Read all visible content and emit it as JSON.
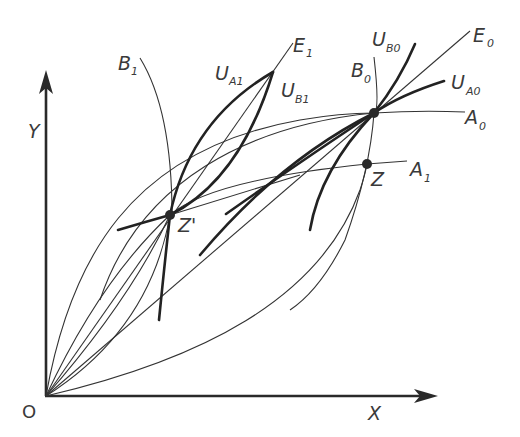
{
  "diagram": {
    "axes": {
      "x_label": "X",
      "y_label": "Y",
      "origin_label": "O"
    },
    "points": {
      "z_prime": "Z'",
      "z": "Z"
    },
    "curves": {
      "b1": {
        "main": "B",
        "sub": "1"
      },
      "b0": {
        "main": "B",
        "sub": "0"
      },
      "ua1": {
        "main": "U",
        "sub": "A1"
      },
      "ub1": {
        "main": "U",
        "sub": "B1"
      },
      "e1": {
        "main": "E",
        "sub": "1"
      },
      "ub0": {
        "main": "U",
        "sub": "B0"
      },
      "e0": {
        "main": "E",
        "sub": "0"
      },
      "ua0": {
        "main": "U",
        "sub": "A0"
      },
      "a0": {
        "main": "A",
        "sub": "0"
      },
      "a1": {
        "main": "A",
        "sub": "1"
      }
    }
  }
}
